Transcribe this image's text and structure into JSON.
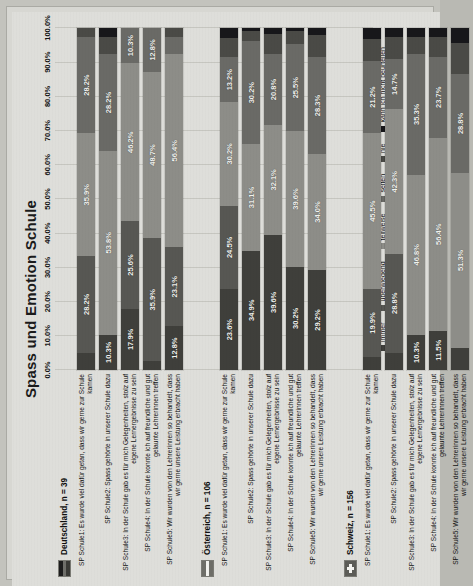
{
  "chart_data": {
    "type": "bar",
    "orientation": "horizontal-stacked",
    "title": "Spass und Emotion Schule",
    "xlabel": "",
    "ylabel": "",
    "xlim": [
      0,
      100
    ],
    "grid": true,
    "legend_position": "bottom",
    "stacked": true,
    "stack_total": 100,
    "tick_labels": [
      "0.0%",
      "10.0%",
      "20.0%",
      "30.0%",
      "40.0%",
      "50.0%",
      "60.0%",
      "70.0%",
      "80.0%",
      "90.0%",
      "100.0%"
    ],
    "tick_values": [
      0,
      10,
      20,
      30,
      40,
      50,
      60,
      70,
      80,
      90,
      100
    ],
    "series": [
      {
        "name": "immer",
        "color": "#3f3f3b"
      },
      {
        "name": "überwiegend",
        "color": "#575753"
      },
      {
        "name": "teilweise",
        "color": "#8d8d88"
      },
      {
        "name": "selten",
        "color": "#6a6a66"
      },
      {
        "name": "nie",
        "color": "#4a4a46"
      },
      {
        "name": "kann ich nicht beurteilen",
        "color": "#17171a"
      }
    ],
    "groups": [
      {
        "name": "Deutschland, n = 39",
        "flag": "de-flag-icon",
        "rows": [
          {
            "label": "SP Schule1: Es wurde viel dafür getan, dass wir gerne zur Schule kamen",
            "values": [
              5.1,
              28.2,
              35.9,
              28.2,
              2.6,
              0.0
            ],
            "labels": [
              "",
              "28.2%",
              "35.9%",
              "28.2%",
              "",
              ""
            ]
          },
          {
            "label": "SP Schule2: Spass gehörte in unserer Schule dazu",
            "values": [
              10.3,
              0.0,
              53.8,
              28.2,
              5.1,
              2.6
            ],
            "labels": [
              "10.3%",
              "",
              "53.8%",
              "28.2%",
              "",
              ""
            ]
          },
          {
            "label": "SP Schule3: In der Schule gab es für mich Gelegenheiten, stolz auf eigene Lernergebnisse zu sein",
            "values": [
              17.9,
              25.6,
              46.2,
              10.3,
              0.0,
              0.0
            ],
            "labels": [
              "17.9%",
              "25.6%",
              "46.2%",
              "10.3%",
              "",
              ""
            ]
          },
          {
            "label": "SP Schule4: In der Schule konnte ich auf freundliche und gut gelaunte Lehrerinnen treffen",
            "values": [
              2.6,
              35.9,
              48.7,
              12.8,
              0.0,
              0.0
            ],
            "labels": [
              "",
              "35.9%",
              "48.7%",
              "12.8%",
              "",
              ""
            ]
          },
          {
            "label": "SP Schule5: Wir wurden von den Lehrerinnen so behandelt, dass wir gerne unsere Leistung erbracht haben",
            "values": [
              12.8,
              23.1,
              56.4,
              5.1,
              2.6,
              0.0
            ],
            "labels": [
              "12.8%",
              "23.1%",
              "56.4%",
              "",
              "",
              ""
            ]
          }
        ]
      },
      {
        "name": "Österreich, n = 106",
        "flag": "at-flag-icon",
        "rows": [
          {
            "label": "SP Schule1: Es wurde viel dafür getan, dass wir gerne zur Schule kamen",
            "values": [
              23.6,
              24.5,
              30.2,
              13.2,
              5.7,
              2.8
            ],
            "labels": [
              "23.6%",
              "24.5%",
              "30.2%",
              "13.2%",
              "",
              ""
            ]
          },
          {
            "label": "SP Schule2: Spass gehörte in unserer Schule dazu",
            "values": [
              34.9,
              0.0,
              31.1,
              30.2,
              2.8,
              0.9
            ],
            "labels": [
              "34.9%",
              "",
              "31.1%",
              "30.2%",
              "",
              ""
            ]
          },
          {
            "label": "SP Schule3: In der Schule gab es für mich Gelegenheiten, stolz auf eigene Lernergebnisse zu sein",
            "values": [
              39.6,
              0.0,
              32.1,
              20.8,
              5.7,
              1.9
            ],
            "labels": [
              "39.6%",
              "",
              "32.1%",
              "20.8%",
              "",
              ""
            ]
          },
          {
            "label": "SP Schule4: In der Schule konnte ich auf freundliche und gut gelaunte Lehrerinnen treffen",
            "values": [
              30.2,
              0.0,
              39.6,
              25.5,
              3.8,
              0.9
            ],
            "labels": [
              "30.2%",
              "",
              "39.6%",
              "25.5%",
              "",
              ""
            ]
          },
          {
            "label": "SP Schule5: Wir wurden von den Lehrerinnen so behandelt, dass wir gerne unsere Leistung erbracht haben",
            "values": [
              29.2,
              0.0,
              34.0,
              28.3,
              6.6,
              1.9
            ],
            "labels": [
              "29.2%",
              "",
              "34.0%",
              "28.3%",
              "",
              ""
            ]
          }
        ]
      },
      {
        "name": "Schweiz, n = 156",
        "flag": "ch-flag-icon",
        "rows": [
          {
            "label": "SP Schule1: Es wurde viel dafür getan, dass wir gerne zur Schule kamen",
            "values": [
              3.8,
              19.9,
              45.5,
              21.2,
              6.4,
              3.2
            ],
            "labels": [
              "",
              "19.9%",
              "45.5%",
              "21.2%",
              "",
              ""
            ]
          },
          {
            "label": "SP Schule2: Spass gehörte in unserer Schule dazu",
            "values": [
              5.1,
              28.8,
              42.3,
              14.7,
              6.4,
              2.7
            ],
            "labels": [
              "",
              "28.8%",
              "42.3%",
              "14.7%",
              "",
              ""
            ]
          },
          {
            "label": "SP Schule3: In der Schule gab es für mich Gelegenheiten, stolz auf eigene Lernergebnisse zu sein",
            "values": [
              10.3,
              0.0,
              46.8,
              35.3,
              5.1,
              2.5
            ],
            "labels": [
              "10.3%",
              "",
              "46.8%",
              "35.3%",
              "",
              ""
            ]
          },
          {
            "label": "SP Schule4: In der Schule konnte ich auf freundliche und gut gelaunte Lehrerinnen treffen",
            "values": [
              11.5,
              0.0,
              56.4,
              23.7,
              5.8,
              2.6
            ],
            "labels": [
              "11.5%",
              "",
              "56.4%",
              "23.7%",
              "",
              ""
            ]
          },
          {
            "label": "SP Schule5: Wir wurden von den Lehrerinnen so behandelt, dass wir gerne unsere Leistung erbracht haben",
            "values": [
              6.4,
              0.0,
              51.3,
              28.8,
              9.0,
              4.5
            ],
            "labels": [
              "",
              "",
              "51.3%",
              "28.8%",
              "",
              ""
            ]
          }
        ]
      }
    ]
  }
}
